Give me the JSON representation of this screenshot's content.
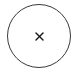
{
  "close_button": {
    "icon": "close-icon",
    "glyph": "×",
    "stroke_color": "#3a3a3a",
    "icon_color": "#1a1a1a",
    "background_color": "#ffffff"
  }
}
